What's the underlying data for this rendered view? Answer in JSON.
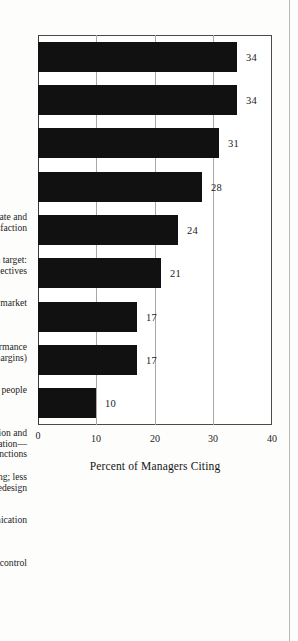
{
  "chart_data": {
    "type": "bar",
    "orientation": "vertical-printed-rotated",
    "title": "",
    "subtitle": "",
    "xlabel": "",
    "ylabel": "Percent of Managers Citing",
    "ylim": [
      0,
      40
    ],
    "yticks": [
      0,
      10,
      20,
      30,
      40
    ],
    "ytick_labels": [
      "0",
      "10",
      "20",
      "30",
      "40"
    ],
    "gridlines": [
      10,
      20,
      30
    ],
    "grid": true,
    "legend": false,
    "legend_position": "none",
    "bar_color": "#111111",
    "categories": [
      "Improved product success rate and\nhigher customer satisfaction",
      "Product developed on target:\ntime, quality, and cost objectives",
      "Faster to market",
      "Improved profit performance\n(revenue and margins)",
      "A learning tool: educate our people",
      "Improved cooperation and coordination—\npeople and functions",
      "Fewer errors; less recycling; less redesign",
      "Improved communication",
      "Better project control"
    ],
    "values": [
      34,
      34,
      31,
      28,
      24,
      21,
      17,
      17,
      10
    ],
    "value_labels": [
      "34",
      "34",
      "31",
      "28",
      "24",
      "21",
      "17",
      "17",
      "10"
    ]
  },
  "axis": {
    "value_axis_title": "Percent of Managers Citing"
  }
}
